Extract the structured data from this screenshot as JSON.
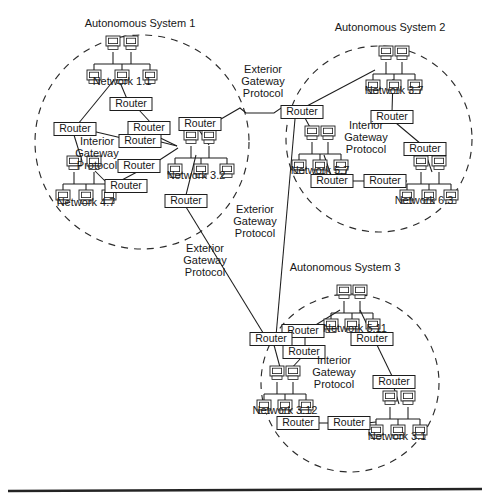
{
  "figure": {
    "type": "network-topology-diagram"
  },
  "autonomous_systems": [
    {
      "id": "as1",
      "label": "Autonomous System 1",
      "label_pos": {
        "x": 140,
        "y": 27
      },
      "circle": {
        "cx": 142,
        "cy": 142,
        "r": 107
      },
      "interior_protocol_label": "Interior\nGateway\nProtocol",
      "interior_protocol_lines": [
        "Interior",
        "Gateway",
        "Protocol"
      ],
      "interior_protocol_pos": {
        "x": 97,
        "y": 145
      },
      "networks": [
        {
          "id": "net-1-1",
          "label": "Network 1.1",
          "x": 122,
          "y": 48,
          "label_x": 122,
          "label_y": 85
        },
        {
          "id": "net-3-2",
          "label": "Network 3.2",
          "x": 193,
          "y": 142,
          "label_x": 196,
          "label_y": 179
        },
        {
          "id": "net-4-7",
          "label": "Network 4.7",
          "x": 86,
          "y": 168,
          "label_x": 86,
          "label_y": 206
        }
      ],
      "routers": [
        {
          "id": "as1-r1",
          "label": "Router",
          "x": 131,
          "y": 104
        },
        {
          "id": "as1-r2",
          "label": "Router",
          "x": 75,
          "y": 129
        },
        {
          "id": "as1-r3",
          "label": "Router",
          "x": 149,
          "y": 128
        },
        {
          "id": "as1-r4",
          "label": "Router",
          "x": 140,
          "y": 141
        },
        {
          "id": "as1-r5",
          "label": "Router",
          "x": 200,
          "y": 124
        },
        {
          "id": "as1-r6",
          "label": "Router",
          "x": 139,
          "y": 166
        },
        {
          "id": "as1-r7",
          "label": "Router",
          "x": 126,
          "y": 186
        },
        {
          "id": "as1-r8",
          "label": "Router",
          "x": 186,
          "y": 201
        }
      ]
    },
    {
      "id": "as2",
      "label": "Autonomous System 2",
      "label_pos": {
        "x": 390,
        "y": 31
      },
      "circle": {
        "cx": 379,
        "cy": 139,
        "r": 93
      },
      "interior_protocol_lines": [
        "Interior",
        "Gateway",
        "Protocol"
      ],
      "interior_protocol_pos": {
        "x": 366,
        "y": 129
      },
      "networks": [
        {
          "id": "net-3-7",
          "label": "Network 3.7",
          "x": 394,
          "y": 58,
          "label_x": 394,
          "label_y": 94
        },
        {
          "id": "net-5-7",
          "label": "Network 5.7",
          "x": 320,
          "y": 138,
          "label_x": 320,
          "label_y": 174
        },
        {
          "id": "net-6-3",
          "label": "Network 6.3",
          "x": 418,
          "y": 168,
          "label_x": 424,
          "label_y": 204
        }
      ],
      "routers": [
        {
          "id": "as2-r1",
          "label": "Router",
          "x": 302,
          "y": 112
        },
        {
          "id": "as2-r2",
          "label": "Router",
          "x": 392,
          "y": 117
        },
        {
          "id": "as2-r3",
          "label": "Router",
          "x": 425,
          "y": 149
        },
        {
          "id": "as2-r4",
          "label": "Router",
          "x": 332,
          "y": 181
        },
        {
          "id": "as2-r5",
          "label": "Router",
          "x": 385,
          "y": 181
        }
      ]
    },
    {
      "id": "as3",
      "label": "Autonomous System 3",
      "label_pos": {
        "x": 345,
        "y": 271
      },
      "circle": {
        "cx": 350,
        "cy": 383,
        "r": 89
      },
      "interior_protocol_lines": [
        "Interior",
        "Gateway",
        "Protocol"
      ],
      "interior_protocol_pos": {
        "x": 334,
        "y": 364
      },
      "networks": [
        {
          "id": "net-5-11",
          "label": "Network 5.11",
          "x": 352,
          "y": 297,
          "label_x": 355,
          "label_y": 332
        },
        {
          "id": "net-3-12",
          "label": "Network 3.12",
          "x": 285,
          "y": 378,
          "label_x": 285,
          "label_y": 414
        },
        {
          "id": "net-3-1",
          "label": "Network 3.1",
          "x": 391,
          "y": 403,
          "label_x": 397,
          "label_y": 440
        }
      ],
      "routers": [
        {
          "id": "as3-r1",
          "label": "Router",
          "x": 303,
          "y": 331
        },
        {
          "id": "as3-r2",
          "label": "Router",
          "x": 271,
          "y": 339
        },
        {
          "id": "as3-r3",
          "label": "Router",
          "x": 304,
          "y": 352
        },
        {
          "id": "as3-r4",
          "label": "Router",
          "x": 372,
          "y": 339
        },
        {
          "id": "as3-r5",
          "label": "Router",
          "x": 394,
          "y": 382
        },
        {
          "id": "as3-r6",
          "label": "Router",
          "x": 298,
          "y": 423
        },
        {
          "id": "as3-r7",
          "label": "Router",
          "x": 349,
          "y": 423
        }
      ]
    }
  ],
  "exterior_gateway_labels": [
    {
      "id": "egp-1",
      "lines": [
        "Exterior",
        "Gateway",
        "Protocol"
      ],
      "x": 263,
      "y": 73
    },
    {
      "id": "egp-2",
      "lines": [
        "Exterior",
        "Gateway",
        "Protocol"
      ],
      "x": 255,
      "y": 213
    },
    {
      "id": "egp-3",
      "lines": [
        "Exterior",
        "Gateway",
        "Protocol"
      ],
      "x": 205,
      "y": 252
    }
  ],
  "colors": {
    "ink": "#1d1d1d",
    "circle_stroke": "#2b2b2b",
    "background": "#ffffff",
    "footer_rule": "#242424"
  },
  "footer_rule": {
    "x1": 8,
    "y1": 491,
    "x2": 482,
    "y2": 489
  }
}
